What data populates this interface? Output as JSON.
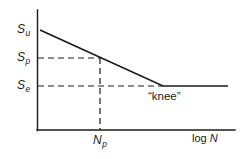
{
  "figure": {
    "background_color": "#ffffff",
    "line_color": "#1a1a1a",
    "text_color": "#1a1a1a"
  },
  "labels": {
    "su": {
      "symbol": "S",
      "subscript": "u",
      "text": "Su"
    },
    "sp": {
      "symbol": "S",
      "subscript": "p",
      "text": "Sp"
    },
    "se": {
      "symbol": "S",
      "subscript": "e",
      "text": "Se"
    },
    "np": {
      "symbol": "N",
      "subscript": "p",
      "text": "Np"
    },
    "x_axis": {
      "prefix": "log ",
      "symbol": "N",
      "text": "log N"
    },
    "knee": "“knee”"
  },
  "chart_data": {
    "type": "line",
    "title": "",
    "xlabel": "log N",
    "ylabel": "",
    "grid": false,
    "legend": null,
    "axes": {
      "x": {
        "origin_px": 37,
        "end_px": 235,
        "baseline_y_px": 130,
        "arrow": false
      },
      "y": {
        "axis_x_px": 37,
        "top_px": 10,
        "bottom_px": 130,
        "arrow": false
      }
    },
    "y_tick_labels": [
      "Su",
      "Sp",
      "Se"
    ],
    "y_tick_pixels": [
      30,
      58,
      86
    ],
    "x_tick_labels": [
      "Np"
    ],
    "x_tick_pixels": [
      100
    ],
    "series": [
      {
        "name": "S-N curve",
        "style": "solid",
        "points_px": [
          [
            40,
            30
          ],
          [
            163,
            86
          ],
          [
            228,
            86
          ]
        ]
      }
    ],
    "annotations": [
      {
        "name": "knee",
        "text": "“knee”",
        "at_px": [
          163,
          86
        ],
        "label_px": [
          148,
          91
        ]
      }
    ],
    "guides": [
      {
        "name": "sp-horizontal-guide",
        "style": "dashed",
        "points_px": [
          [
            38,
            58
          ],
          [
            100,
            58
          ]
        ]
      },
      {
        "name": "se-horizontal-guide",
        "style": "dashed",
        "points_px": [
          [
            38,
            86
          ],
          [
            163,
            86
          ]
        ]
      },
      {
        "name": "np-vertical-guide",
        "style": "dashed",
        "points_px": [
          [
            100,
            58
          ],
          [
            100,
            130
          ]
        ]
      }
    ]
  }
}
